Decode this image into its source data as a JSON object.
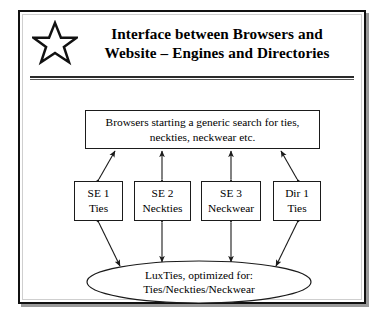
{
  "figure": {
    "icon": "star-icon",
    "title": {
      "line1": "Interface between Browsers and",
      "line2": "Website – Engines and Directories"
    }
  },
  "diagram": {
    "type": "flow-diagram",
    "top_node": {
      "name": "browsers-node",
      "line1": "Browsers starting a generic search for ties,",
      "line2": "neckties, neckwear etc."
    },
    "middle_nodes": [
      {
        "name": "se-1",
        "line1": "SE 1",
        "line2": "Ties"
      },
      {
        "name": "se-2",
        "line1": "SE 2",
        "line2": "Neckties"
      },
      {
        "name": "se-3",
        "line1": "SE 3",
        "line2": "Neckwear"
      },
      {
        "name": "dir-1",
        "line1": "Dir 1",
        "line2": "Ties"
      }
    ],
    "bottom_node": {
      "name": "website-node",
      "line1": "LuxTies, optimized for:",
      "line2": "Ties/Neckties/Neckwear"
    },
    "connectors": [
      {
        "from": "se-1",
        "to": "browsers-node",
        "style": "double-headed"
      },
      {
        "from": "se-2",
        "to": "browsers-node",
        "style": "double-headed"
      },
      {
        "from": "se-3",
        "to": "browsers-node",
        "style": "double-headed"
      },
      {
        "from": "dir-1",
        "to": "browsers-node",
        "style": "double-headed"
      },
      {
        "from": "website-node",
        "to": "se-1",
        "style": "double-headed"
      },
      {
        "from": "website-node",
        "to": "se-2",
        "style": "double-headed"
      },
      {
        "from": "website-node",
        "to": "se-3",
        "style": "double-headed"
      },
      {
        "from": "website-node",
        "to": "dir-1",
        "style": "double-headed"
      }
    ]
  },
  "colors": {
    "ink": "#000000",
    "frame_border": "#111111",
    "frame_shadow": "#9a9a9a",
    "background": "#ffffff"
  }
}
